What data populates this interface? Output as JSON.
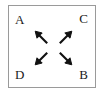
{
  "figure": {
    "type": "diagram",
    "border_color": "#9a9a9a",
    "background_color": "#ffffff",
    "arrow_color": "#111111",
    "label_color": "#1a1a1a",
    "corner_labels": [
      {
        "id": "A",
        "text": "A",
        "position": "top-left"
      },
      {
        "id": "C",
        "text": "C",
        "position": "top-right"
      },
      {
        "id": "D",
        "text": "D",
        "position": "bottom-left"
      },
      {
        "id": "B",
        "text": "B",
        "position": "bottom-right"
      }
    ],
    "arrows": [
      {
        "id": "arrow-up-left",
        "direction": "up-left",
        "points_to": "A"
      },
      {
        "id": "arrow-up-right",
        "direction": "up-right",
        "points_to": "C"
      },
      {
        "id": "arrow-down-left",
        "direction": "down-left",
        "points_to": "D"
      },
      {
        "id": "arrow-down-right",
        "direction": "down-right",
        "points_to": "B"
      }
    ]
  }
}
